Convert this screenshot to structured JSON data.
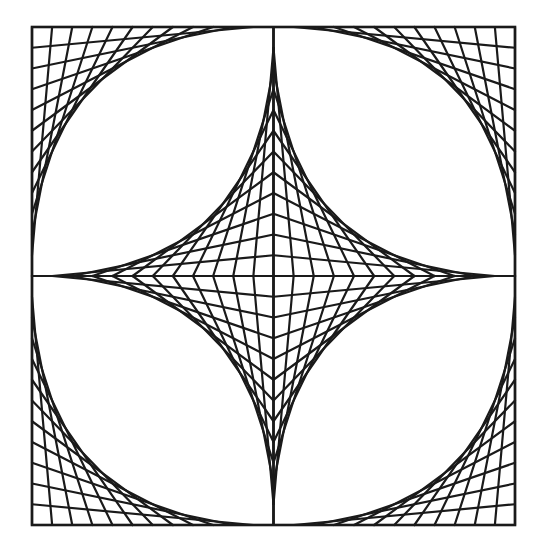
{
  "figure": {
    "title": "Curve stitching pattern: inscribed circle envelopes and central astroid",
    "background": "#ffffff",
    "stroke_color": "#1a1a1a",
    "stroke_width": 2.2,
    "frame_stroke_width": 2.6,
    "square": {
      "x0": 32,
      "y0": 27,
      "x1": 515,
      "y1": 525
    },
    "center": {
      "x": 273.5,
      "y": 276
    },
    "divisions_per_half_edge": 12,
    "components": [
      {
        "name": "outer-corner-envelopes",
        "count": 4,
        "vertex": "square corners",
        "shape": "convex arcs approximating inscribed circle"
      },
      {
        "name": "inner-astroid-envelopes",
        "count": 4,
        "vertex": "square center",
        "shape": "four-pointed concave star"
      },
      {
        "name": "center-axes",
        "count": 2,
        "shape": "horizontal and vertical midlines"
      }
    ]
  }
}
